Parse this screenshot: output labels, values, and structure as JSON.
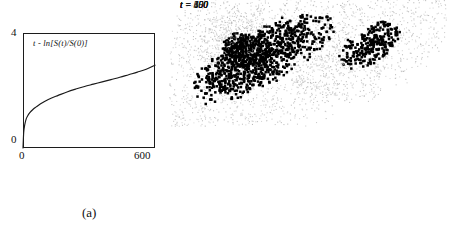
{
  "figure": {
    "background_color": "#ffffff",
    "ink_color": "#1a1a1a",
    "halo_color": "#b4b4b4",
    "core_color": "#000000"
  },
  "panel_a": {
    "caption": "(a)",
    "curve_label": "t - ln[S(t)/S(0)]",
    "y_tick_top": "4",
    "y_tick_bottom": "0",
    "x_tick_left": "0",
    "x_tick_right": "600"
  },
  "panel_b": {
    "caption": "(b)",
    "snapshots": [
      {
        "label": "t = 150",
        "time": 150
      },
      {
        "label": "t = 300",
        "time": 300
      },
      {
        "label": "t = 450",
        "time": 450
      },
      {
        "label": "t = 600",
        "time": 600
      }
    ]
  },
  "chart_data": {
    "type": "line",
    "title": "",
    "subtitle": "",
    "xlabel": "t",
    "ylabel": "-ln[S(t)/S(0)]",
    "annotations": [
      "t - ln[S(t)/S(0)]"
    ],
    "xlim": [
      0,
      600
    ],
    "ylim": [
      0,
      4
    ],
    "xticks": [
      0,
      600
    ],
    "yticks": [
      0,
      4
    ],
    "xticklabels": [
      "0",
      "600"
    ],
    "yticklabels": [
      "0",
      "4"
    ],
    "grid": false,
    "legend": false,
    "series": [
      {
        "name": "-ln[S(t)/S(0)]",
        "color": "#1a1a1a",
        "x": [
          0,
          3,
          6,
          10,
          15,
          20,
          30,
          45,
          60,
          80,
          100,
          130,
          160,
          200,
          240,
          280,
          320,
          360,
          400,
          440,
          480,
          520,
          560,
          600
        ],
        "y": [
          0.0,
          0.52,
          0.72,
          0.88,
          1.02,
          1.1,
          1.22,
          1.34,
          1.43,
          1.54,
          1.63,
          1.74,
          1.83,
          1.95,
          2.05,
          2.14,
          2.22,
          2.3,
          2.38,
          2.46,
          2.55,
          2.64,
          2.74,
          2.88
        ]
      }
    ]
  },
  "cluster_data": {
    "type": "scatter",
    "description": "Four fractal growth cluster snapshots; dense black core surrounded by sparse grey halo",
    "panels": [
      {
        "label": "t = 150",
        "time": 150,
        "core_radius": 13,
        "halo_radius": 34,
        "elongation": 1.1,
        "angle_deg": -20,
        "core_points": 170,
        "halo_points": 520,
        "seed": 11
      },
      {
        "label": "t = 300",
        "time": 300,
        "core_radius": 17,
        "halo_radius": 48,
        "elongation": 1.9,
        "angle_deg": -32,
        "core_points": 260,
        "halo_points": 900,
        "seed": 23
      },
      {
        "label": "t = 450",
        "time": 450,
        "core_radius": 22,
        "halo_radius": 70,
        "elongation": 2.6,
        "angle_deg": -30,
        "core_points": 420,
        "halo_points": 1500,
        "seed": 37
      },
      {
        "label": "t = 600",
        "time": 600,
        "core_radius": 26,
        "halo_radius": 80,
        "elongation": 3.1,
        "angle_deg": -28,
        "core_points": 560,
        "halo_points": 1900,
        "seed": 53
      }
    ]
  }
}
